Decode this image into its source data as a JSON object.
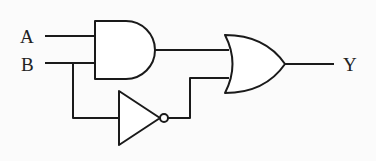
{
  "diagram": {
    "type": "logic-circuit",
    "inputs": [
      {
        "id": "A",
        "label": "A"
      },
      {
        "id": "B",
        "label": "B"
      }
    ],
    "output": {
      "id": "Y",
      "label": "Y"
    },
    "gates": [
      {
        "id": "and1",
        "type": "AND",
        "inputs": [
          "A",
          "B"
        ]
      },
      {
        "id": "not1",
        "type": "NOT",
        "inputs": [
          "B"
        ]
      },
      {
        "id": "or1",
        "type": "OR",
        "inputs": [
          "and1",
          "not1"
        ],
        "drives": "Y"
      }
    ],
    "expression": "Y = A·B + B'"
  },
  "colors": {
    "line": "#1a1a1a",
    "background": "#fbfbfb"
  }
}
